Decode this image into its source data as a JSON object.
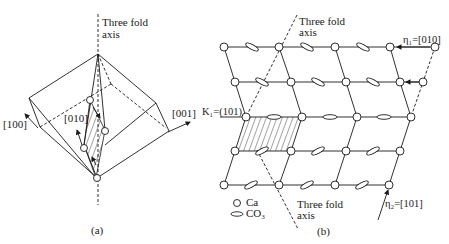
{
  "panel_a": {
    "caption": "(a)",
    "axis_label_line1": "Three fold",
    "axis_label_line2": "axis",
    "dir_100": "[100]",
    "dir_010": "[010]",
    "dir_001": "[001]"
  },
  "panel_b": {
    "caption": "(b)",
    "top_axis_line1": "Three fold",
    "top_axis_line2": "axis",
    "bottom_axis_line1": "Three fold",
    "bottom_axis_line2": "axis",
    "eta1": "η₁=[010]",
    "eta2": "η₂=[101]",
    "k1": "K₁=(101)",
    "legend": [
      {
        "symbol": "circle",
        "label": "Ca"
      },
      {
        "symbol": "ellipse",
        "label": "CO₃"
      }
    ]
  },
  "colors": {
    "line": "#1a1a1a",
    "background": "#ffffff"
  }
}
